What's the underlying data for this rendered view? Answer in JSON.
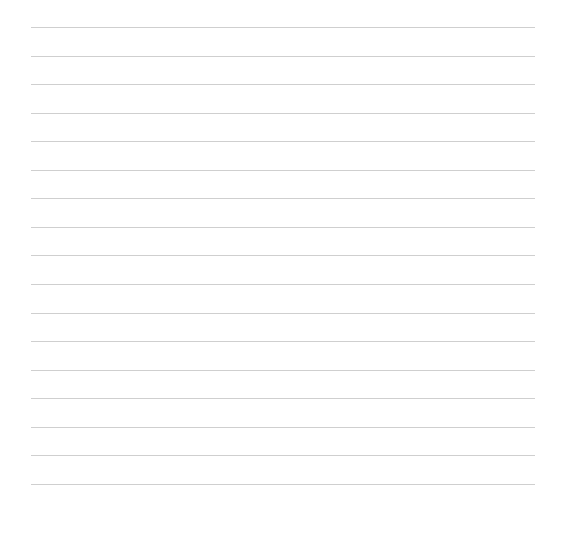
{
  "page": {
    "type": "lined-paper",
    "background_color": "#ffffff",
    "line_color": "#cfcfcf",
    "line_count": 17,
    "line_left": 31,
    "line_right": 535,
    "first_line_y": 27,
    "line_spacing": 28.56,
    "lines": [
      "",
      "",
      "",
      "",
      "",
      "",
      "",
      "",
      "",
      "",
      "",
      "",
      "",
      "",
      "",
      "",
      ""
    ]
  }
}
